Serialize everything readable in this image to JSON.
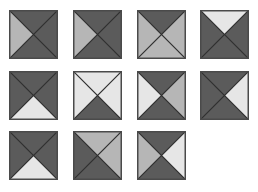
{
  "colors": {
    "D": "#5b5b5b",
    "M": "#b6b6b6",
    "L": "#e6e6e6",
    "line": "#2e2e2e",
    "border": "#4a4a4a"
  },
  "tiles": [
    {
      "row": 1,
      "col": 1,
      "x": 9,
      "y": 10,
      "top": "D",
      "right": "D",
      "bottom": "D",
      "left": "M"
    },
    {
      "row": 1,
      "col": 2,
      "x": 73,
      "y": 10,
      "top": "D",
      "right": "D",
      "bottom": "D",
      "left": "M"
    },
    {
      "row": 1,
      "col": 3,
      "x": 137,
      "y": 10,
      "top": "D",
      "right": "M",
      "bottom": "M",
      "left": "M"
    },
    {
      "row": 1,
      "col": 4,
      "x": 200,
      "y": 10,
      "top": "L",
      "right": "D",
      "bottom": "D",
      "left": "D"
    },
    {
      "row": 2,
      "col": 1,
      "x": 9,
      "y": 71,
      "top": "D",
      "right": "D",
      "bottom": "L",
      "left": "D"
    },
    {
      "row": 2,
      "col": 2,
      "x": 73,
      "y": 71,
      "top": "L",
      "right": "L",
      "bottom": "D",
      "left": "L"
    },
    {
      "row": 2,
      "col": 3,
      "x": 137,
      "y": 71,
      "top": "D",
      "right": "M",
      "bottom": "D",
      "left": "L"
    },
    {
      "row": 2,
      "col": 4,
      "x": 200,
      "y": 71,
      "top": "D",
      "right": "L",
      "bottom": "D",
      "left": "D"
    },
    {
      "row": 3,
      "col": 1,
      "x": 9,
      "y": 131,
      "top": "D",
      "right": "D",
      "bottom": "L",
      "left": "D"
    },
    {
      "row": 3,
      "col": 2,
      "x": 73,
      "y": 131,
      "top": "M",
      "right": "M",
      "bottom": "D",
      "left": "D"
    },
    {
      "row": 3,
      "col": 3,
      "x": 137,
      "y": 131,
      "top": "D",
      "right": "L",
      "bottom": "D",
      "left": "M"
    }
  ]
}
